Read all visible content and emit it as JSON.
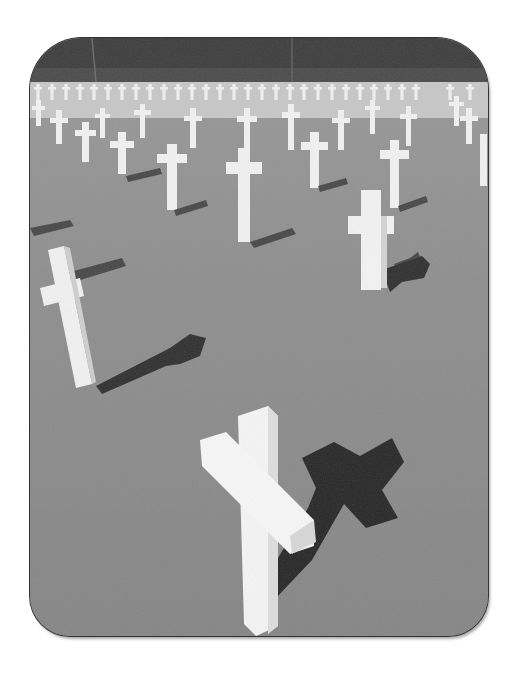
{
  "image": {
    "description": "Black-and-white photograph of a military cemetery with rows of white Latin crosses casting dark shadows on a grass lawn, trees in the background",
    "style": "grayscale photo in rounded-corner frame",
    "colors": {
      "page_background": "#ffffff",
      "trees": "#3a3a3a",
      "grass": "#8c8c8c",
      "cross": "#f4f4f4",
      "cross_side": "#d6d6d6",
      "shadow": "#2e2e2e"
    }
  }
}
